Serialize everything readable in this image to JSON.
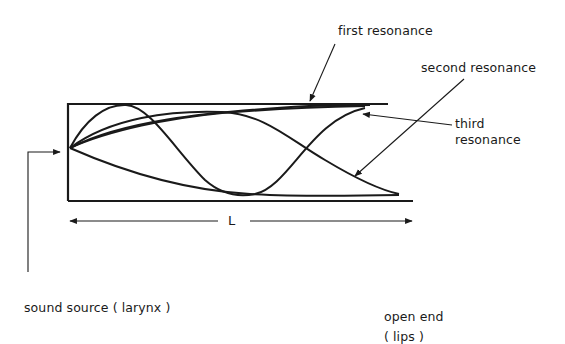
{
  "diagram": {
    "labels": {
      "first_resonance": "first resonance",
      "second_resonance": "second resonance",
      "third_resonance_line1": "third",
      "third_resonance_line2": "resonance",
      "length": "L",
      "sound_source": "sound source ( larynx )",
      "open_end_line1": "open end",
      "open_end_line2": "( lips )"
    },
    "colors": {
      "ink": "#1a1a1a",
      "background": "#ffffff"
    }
  }
}
